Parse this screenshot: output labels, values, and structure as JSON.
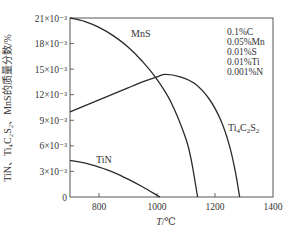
{
  "chart_data": {
    "type": "line",
    "title": "",
    "xlabel": "T/℃",
    "ylabel": "TiN、Ti4C2S2、MnS的质量分数/%",
    "xlim": [
      700,
      1400
    ],
    "ylim": [
      0,
      0.021
    ],
    "grid": false,
    "x_ticks": [
      800,
      1000,
      1200,
      1400
    ],
    "x_tick_labels": [
      "800",
      "1000",
      "1200",
      "1400"
    ],
    "y_ticks": [
      0,
      0.003,
      0.006,
      0.009,
      0.012,
      0.015,
      0.018,
      0.021
    ],
    "y_tick_labels": [
      "0",
      "3×10⁻³",
      "6×10⁻³",
      "9×10⁻³",
      "12×10⁻³",
      "15×10⁻³",
      "18×10⁻³",
      "21×10⁻³"
    ],
    "series": [
      {
        "name": "MnS",
        "x": [
          700,
          750,
          800,
          850,
          900,
          950,
          1000,
          1050,
          1100,
          1120,
          1140
        ],
        "values": [
          0.021,
          0.0206,
          0.0199,
          0.0189,
          0.0176,
          0.0159,
          0.0138,
          0.011,
          0.0068,
          0.004,
          0.0
        ]
      },
      {
        "name": "Ti4C2S2",
        "x": [
          700,
          750,
          800,
          850,
          900,
          950,
          1000,
          1030,
          1080,
          1130,
          1180,
          1220,
          1250,
          1270,
          1285
        ],
        "values": [
          0.01,
          0.0107,
          0.0114,
          0.0121,
          0.0128,
          0.0135,
          0.0141,
          0.0144,
          0.0141,
          0.0133,
          0.0115,
          0.009,
          0.006,
          0.003,
          0.0
        ]
      },
      {
        "name": "TiN",
        "x": [
          700,
          750,
          800,
          850,
          900,
          950,
          1000,
          1010
        ],
        "values": [
          0.0043,
          0.004,
          0.0035,
          0.0029,
          0.0021,
          0.0012,
          0.0002,
          0.0
        ]
      }
    ],
    "series_labels": [
      {
        "text": "MnS",
        "x": 905,
        "y": 0.0192
      },
      {
        "text": "Ti4C2S2",
        "x": 1315,
        "y": 0.0081
      },
      {
        "text": "TiN",
        "x": 750,
        "y": 0.0052
      }
    ],
    "annotations": [
      "0.1%C",
      "0.05%Mn",
      "0.01%S",
      "0.01%Ti",
      "0.001%N"
    ],
    "legend_position": "upper right (composition note)"
  },
  "labels": {
    "mns": "MnS",
    "tin": "TiN",
    "ti_main": "Ti",
    "ti_sub4": "4",
    "c_main": "C",
    "c_sub2": "2",
    "s_main": "S",
    "s_sub2": "2",
    "xlabel_T": "T",
    "xlabel_unit": "/℃",
    "ylabel_text": "TiN、Ti₄C₂S₂、MnS的质量分数/%"
  },
  "composition": [
    "0.1%C",
    "0.05%Mn",
    "0.01%S",
    "0.01%Ti",
    "0.001%N"
  ],
  "yticks": [
    "0",
    "3×10⁻³",
    "6×10⁻³",
    "9×10⁻³",
    "12×10⁻³",
    "15×10⁻³",
    "18×10⁻³",
    "21×10⁻³"
  ],
  "xticks": [
    "800",
    "1000",
    "1200",
    "1400"
  ]
}
